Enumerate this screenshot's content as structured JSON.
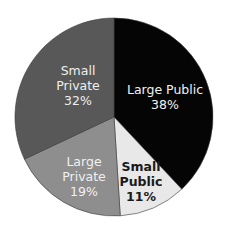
{
  "chart_data": {
    "type": "pie",
    "title": "",
    "start_angle_deg": 0,
    "direction": "clockwise",
    "categories": [
      "Large Public",
      "Small Public",
      "Large Private",
      "Small Private"
    ],
    "values": [
      38,
      11,
      19,
      32
    ],
    "labels": [
      "Large Public 38%",
      "Small Public 11%",
      "Large Private 19%",
      "Small Private 32%"
    ],
    "colors": [
      "#050505",
      "#e8e8e8",
      "#8e8e8e",
      "#585858"
    ],
    "label_colors": [
      "#f2f2f2",
      "#1a1a1a",
      "#f0f0f0",
      "#eeeeee"
    ],
    "legend": "none"
  },
  "slices": [
    {
      "name": "Large Public",
      "lines": [
        "Large Public",
        "38%"
      ]
    },
    {
      "name": "Small Public",
      "lines": [
        "Small",
        "Public",
        "11%"
      ]
    },
    {
      "name": "Large Private",
      "lines": [
        "Large",
        "Private",
        "19%"
      ]
    },
    {
      "name": "Small Private",
      "lines": [
        "Small",
        "Private",
        "32%"
      ]
    }
  ]
}
